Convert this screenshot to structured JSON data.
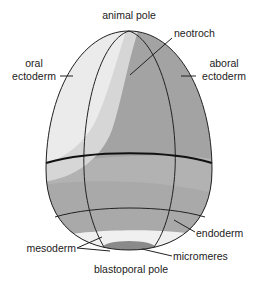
{
  "labels": {
    "animal_pole": "animal pole",
    "neotroch": "neotroch",
    "oral": "oral",
    "oral_ectoderm": "ectoderm",
    "aboral": "aboral",
    "aboral_ectoderm": "ectoderm",
    "endoderm": "endoderm",
    "mesoderm": "mesoderm",
    "micromeres": "micromeres",
    "blastoporal_pole": "blastoporal pole"
  },
  "colors": {
    "oral_ectoderm": "#ebebeb",
    "neotroch": "#d6d6d6",
    "aboral_ectoderm": "#a3a3a3",
    "lower_band": "#b4b4b4",
    "endoderm": "#a8a8a8",
    "mesoderm": "#f0f0f0",
    "micromeres": "#8a8a8a",
    "outline": "#222222"
  }
}
